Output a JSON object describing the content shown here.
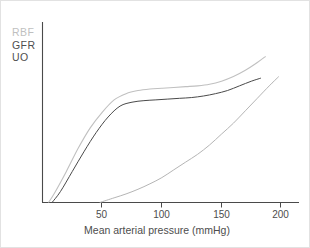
{
  "chart_data": {
    "type": "line",
    "title": "",
    "subtitle": "",
    "xlabel": "Mean arterial pressure (mmHg)",
    "ylabel": "",
    "xlim": [
      0,
      210
    ],
    "ylim": [
      0,
      100
    ],
    "xticks": [
      50,
      100,
      150,
      200
    ],
    "xtick_labels": [
      "50",
      "100",
      "150",
      "200"
    ],
    "yticks": [],
    "ytick_labels": [],
    "grid": false,
    "legend_position": "top-left",
    "annotations": [],
    "series": [
      {
        "name": "RBF",
        "color": "#c0c0c0",
        "x": [
          5,
          10,
          20,
          30,
          40,
          50,
          60,
          70,
          80,
          90,
          100,
          110,
          120,
          130,
          140,
          150,
          160,
          170,
          180,
          187
        ],
        "values": [
          0,
          6,
          20,
          35,
          48,
          58,
          66,
          70,
          72,
          73,
          73.5,
          74,
          74.5,
          75,
          76,
          78,
          81,
          85,
          90,
          94
        ]
      },
      {
        "name": "GFR",
        "color": "#4a4a4a",
        "x": [
          8,
          15,
          25,
          35,
          45,
          55,
          65,
          75,
          85,
          95,
          105,
          115,
          125,
          135,
          145,
          155,
          165,
          175,
          183
        ],
        "values": [
          0,
          7,
          20,
          33,
          45,
          55,
          62,
          64.5,
          65.5,
          66,
          66.5,
          67,
          67.5,
          68.5,
          70,
          72,
          75,
          78,
          80
        ]
      },
      {
        "name": "UO",
        "color": "#b5b5b5",
        "x": [
          48,
          60,
          70,
          80,
          90,
          100,
          110,
          120,
          130,
          140,
          150,
          160,
          170,
          180,
          190,
          198
        ],
        "values": [
          0,
          3,
          5.5,
          8.5,
          12,
          16,
          21,
          26,
          31,
          37,
          44,
          51,
          59,
          67,
          75,
          81
        ]
      }
    ]
  },
  "legend": {
    "items": [
      {
        "label": "RBF",
        "color": "#bfbfbf"
      },
      {
        "label": "GFR",
        "color": "#4e4e4e"
      },
      {
        "label": "UO",
        "color": "#4e4e4e"
      }
    ]
  },
  "axis": {
    "x_title": "Mean arterial pressure (mmHg)",
    "tick_50": "50",
    "tick_100": "100",
    "tick_150": "150",
    "tick_200": "200"
  },
  "colors": {
    "frame": "#e2e2e2",
    "axis_line": "#4a4a4a",
    "rbf": "#c0c0c0",
    "gfr": "#4a4a4a",
    "uo": "#b5b5b5",
    "text": "#4d4d4d"
  }
}
